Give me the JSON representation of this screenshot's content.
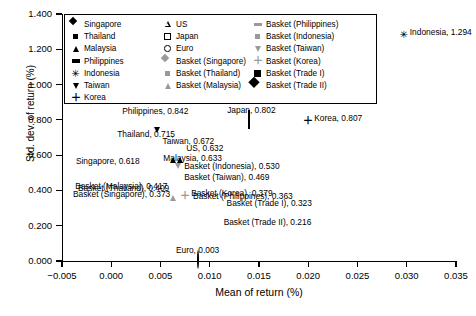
{
  "chart_data": {
    "type": "scatter",
    "title": "",
    "xlabel": "Mean of return (%)",
    "ylabel": "Std. dev. of return (%)",
    "xlim": [
      -0.005,
      0.035
    ],
    "ylim": [
      0.0,
      1.4
    ],
    "xticks": [
      "−0.005",
      "0.000",
      "0.005",
      "0.010",
      "0.015",
      "0.020",
      "0.025",
      "0.030",
      "0.035"
    ],
    "xtick_values": [
      -0.005,
      0.0,
      0.005,
      0.01,
      0.015,
      0.02,
      0.025,
      0.03,
      0.035
    ],
    "yticks": [
      "0.000",
      "0.200",
      "0.400",
      "0.600",
      "0.800",
      "1.000",
      "1.200",
      "1.400"
    ],
    "ytick_values": [
      0.0,
      0.2,
      0.4,
      0.6,
      0.8,
      1.0,
      1.2,
      1.4
    ],
    "grid": false,
    "legend_position": "top-left-inside",
    "points": [
      {
        "name": "Indonesia",
        "x": 0.0297,
        "y": 1.294,
        "marker": "star",
        "color": "#000000",
        "label": "Indonesia, 1.294",
        "label_pos": "right"
      },
      {
        "name": "Philippines",
        "x": 0.0005,
        "y": 0.842,
        "marker": "dash",
        "color": "#000000",
        "label": "Philippines, 0.842",
        "label_pos": "right"
      },
      {
        "name": "Korea",
        "x": 0.02,
        "y": 0.807,
        "marker": "plus",
        "color": "#000000",
        "label": "Korea, 0.807",
        "label_pos": "right"
      },
      {
        "name": "Japan",
        "x": 0.014,
        "y": 0.802,
        "marker": "osquare",
        "color": "#000000",
        "label": "Japan, 0.802",
        "label_pos": "above"
      },
      {
        "name": "Thailand",
        "x": 0.0,
        "y": 0.715,
        "marker": "square",
        "color": "#000000",
        "label": "Thailand, 0.715",
        "label_pos": "right"
      },
      {
        "name": "Taiwan",
        "x": 0.0046,
        "y": 0.672,
        "marker": "dtri",
        "color": "#000000",
        "label": "Taiwan, 0.672",
        "label_pos": "right"
      },
      {
        "name": "US",
        "x": 0.007,
        "y": 0.632,
        "marker": "otri",
        "color": "#000000",
        "label": "US, 0.632",
        "label_pos": "right"
      },
      {
        "name": "Malaysia",
        "x": 0.0063,
        "y": 0.633,
        "marker": "tri",
        "color": "#000000",
        "label": "Malaysia, 0.633",
        "label_pos": "below"
      },
      {
        "name": "Singapore",
        "x": 0.0025,
        "y": 0.618,
        "marker": "diamond",
        "color": "#000000",
        "label": "Singapore, 0.618",
        "label_pos": "below-left"
      },
      {
        "name": "Basket (Indonesia)",
        "x": 0.0068,
        "y": 0.53,
        "marker": "square",
        "color": "#9a9a9a",
        "label": "Basket (Indonesia), 0.530",
        "label_pos": "right"
      },
      {
        "name": "Basket (Taiwan)",
        "x": 0.0068,
        "y": 0.469,
        "marker": "dtri",
        "color": "#9a9a9a",
        "label": "Basket (Taiwan), 0.469",
        "label_pos": "right"
      },
      {
        "name": "Basket (Malaysia)",
        "x": 0.0063,
        "y": 0.417,
        "marker": "tri",
        "color": "#9a9a9a",
        "label": "Basket (Malaysia), 0.417",
        "label_pos": "left"
      },
      {
        "name": "Basket (Korea)",
        "x": 0.0075,
        "y": 0.379,
        "marker": "plus",
        "color": "#9a9a9a",
        "label": "Basket (Korea), 0.379",
        "label_pos": "right"
      },
      {
        "name": "Basket (Thailand)",
        "x": 0.0065,
        "y": 0.409,
        "marker": "square",
        "color": "#9a9a9a",
        "label": "Basket (Thailand), 0.409",
        "label_pos": "left"
      },
      {
        "name": "Basket (Philippines)",
        "x": 0.0077,
        "y": 0.363,
        "marker": "dash",
        "color": "#9a9a9a",
        "label": "Basket (Philippines), 0.363",
        "label_pos": "right"
      },
      {
        "name": "Basket (Singapore)",
        "x": 0.0066,
        "y": 0.373,
        "marker": "diamond",
        "color": "#9a9a9a",
        "label": "Basket (Singapore), 0.373",
        "label_pos": "left"
      },
      {
        "name": "Basket (Trade I)",
        "x": 0.0111,
        "y": 0.323,
        "marker": "diamond-b",
        "color": "#000000",
        "label": "Basket (Trade I), 0.323",
        "label_pos": "right"
      },
      {
        "name": "Basket (Trade II)",
        "x": 0.0108,
        "y": 0.216,
        "marker": "square-b",
        "color": "#000000",
        "label": "Basket (Trade II), 0.216",
        "label_pos": "right"
      },
      {
        "name": "Euro",
        "x": 0.0088,
        "y": 0.003,
        "marker": "ocirc",
        "color": "#000000",
        "label": "Euro, 0.003",
        "label_pos": "above"
      }
    ]
  },
  "legend": {
    "columns": [
      {
        "items": [
          {
            "label": "Singapore",
            "marker": "diamond",
            "color": "#000000"
          },
          {
            "label": "Thailand",
            "marker": "square",
            "color": "#000000"
          },
          {
            "label": "Malaysia",
            "marker": "tri",
            "color": "#000000"
          },
          {
            "label": "Philippines",
            "marker": "dash",
            "color": "#000000"
          },
          {
            "label": "Indonesia",
            "marker": "star",
            "color": "#000000"
          },
          {
            "label": "Taiwan",
            "marker": "dtri",
            "color": "#000000"
          },
          {
            "label": "Korea",
            "marker": "plus",
            "color": "#000000"
          }
        ]
      },
      {
        "items": [
          {
            "label": "US",
            "marker": "otri",
            "color": "#000000"
          },
          {
            "label": "Japan",
            "marker": "osquare",
            "color": "#000000"
          },
          {
            "label": "Euro",
            "marker": "ocirc",
            "color": "#000000"
          },
          {
            "label": "Basket (Singapore)",
            "marker": "diamond",
            "color": "#9a9a9a"
          },
          {
            "label": "Basket (Thailand)",
            "marker": "square",
            "color": "#9a9a9a"
          },
          {
            "label": "Basket (Malaysia)",
            "marker": "tri",
            "color": "#9a9a9a"
          }
        ]
      },
      {
        "items": [
          {
            "label": "Basket (Philippines)",
            "marker": "dash",
            "color": "#9a9a9a"
          },
          {
            "label": "Basket (Indonesia)",
            "marker": "square",
            "color": "#9a9a9a"
          },
          {
            "label": "Basket (Taiwan)",
            "marker": "dtri",
            "color": "#9a9a9a"
          },
          {
            "label": "Basket (Korea)",
            "marker": "plus",
            "color": "#9a9a9a"
          },
          {
            "label": "Basket (Trade I)",
            "marker": "square-b",
            "color": "#000000"
          },
          {
            "label": "Basket (Trade II)",
            "marker": "diamond-b",
            "color": "#000000"
          }
        ]
      }
    ]
  }
}
